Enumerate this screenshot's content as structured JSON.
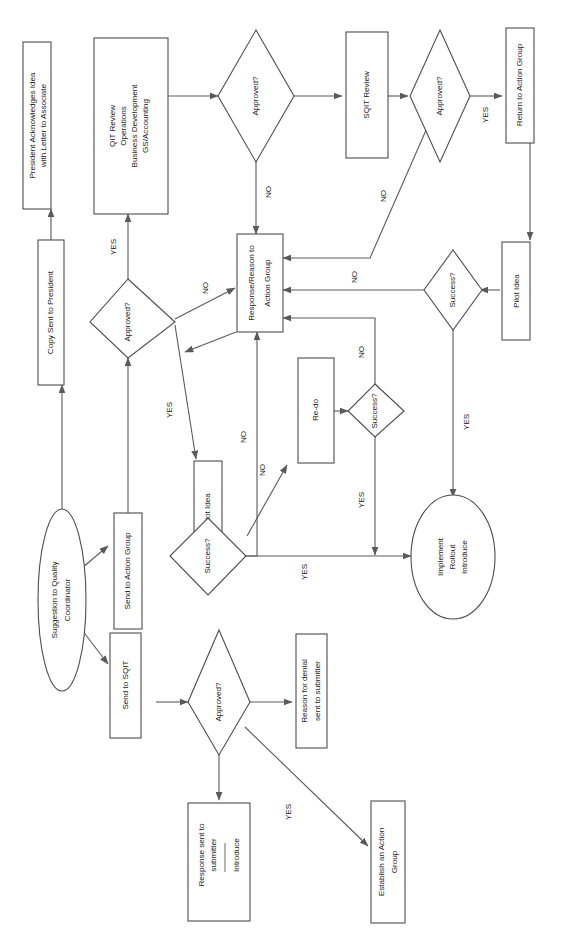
{
  "diagram": {
    "orientation": "rotated-90-ccw",
    "canvas": {
      "width": 564,
      "height": 951
    },
    "colors": {
      "background": "#ffffff",
      "shape_stroke": "#4d4d4d",
      "edge_stroke": "#5a5a5a",
      "text": "#1a1a1a"
    },
    "nodes": [
      {
        "id": "start",
        "shape": "ellipse",
        "lines": [
          "Suggestion to Quality",
          "Coordinator"
        ]
      },
      {
        "id": "send_action",
        "shape": "box",
        "lines": [
          "Send to Action Group"
        ]
      },
      {
        "id": "send_sqit",
        "shape": "box",
        "lines": [
          "Send to SQIT"
        ]
      },
      {
        "id": "approved_mid",
        "shape": "diamond",
        "lines": [
          "Approved?"
        ]
      },
      {
        "id": "qit_review",
        "shape": "box",
        "lines": [
          "QIT Review",
          "Operations",
          "Business Development",
          "GS/Accounting"
        ]
      },
      {
        "id": "approved_top",
        "shape": "diamond",
        "lines": [
          "Approved?"
        ]
      },
      {
        "id": "sqit_review",
        "shape": "box",
        "lines": [
          "SQIT Review"
        ]
      },
      {
        "id": "approved_sqit",
        "shape": "diamond",
        "lines": [
          "Approved?"
        ]
      },
      {
        "id": "return_action",
        "shape": "box",
        "lines": [
          "Return to Action Group"
        ]
      },
      {
        "id": "pilot_idea_right",
        "shape": "box",
        "lines": [
          "Pilot Idea"
        ]
      },
      {
        "id": "success_right",
        "shape": "diamond",
        "lines": [
          "Success?"
        ]
      },
      {
        "id": "response_reason",
        "shape": "box",
        "lines": [
          "Response/Reason to",
          "Action Group"
        ]
      },
      {
        "id": "copy_president",
        "shape": "box",
        "lines": [
          "Copy Sent to President"
        ]
      },
      {
        "id": "president_ack",
        "shape": "box",
        "lines": [
          "President Acknowledges Idea",
          "with Letter to Associate"
        ]
      },
      {
        "id": "pilot_idea_left",
        "shape": "box",
        "lines": [
          "Pilot Idea"
        ]
      },
      {
        "id": "success_left",
        "shape": "diamond",
        "lines": [
          "Success?"
        ]
      },
      {
        "id": "redo",
        "shape": "box",
        "lines": [
          "Re-do"
        ]
      },
      {
        "id": "success_redo",
        "shape": "diamond",
        "lines": [
          "Success?"
        ]
      },
      {
        "id": "implement",
        "shape": "ellipse",
        "lines": [
          "Implement",
          "Rollout",
          "Introduce"
        ]
      },
      {
        "id": "approved_bottom",
        "shape": "diamond",
        "lines": [
          "Approved?"
        ]
      },
      {
        "id": "reason_denial",
        "shape": "box",
        "lines": [
          "Reason for denial",
          "sent to submitter"
        ]
      },
      {
        "id": "response_submit",
        "shape": "box",
        "lines": [
          "Response sent to",
          "submitter"
        ],
        "lines_after_rule": [
          "Introduce"
        ]
      },
      {
        "id": "establish_group",
        "shape": "box",
        "lines": [
          "Establish an Action",
          "Group"
        ]
      }
    ],
    "edge_labels": {
      "yes": "YES",
      "no": "NO"
    },
    "edges": [
      {
        "from": "start",
        "to": "send_action",
        "label": ""
      },
      {
        "from": "start",
        "to": "send_sqit",
        "label": ""
      },
      {
        "from": "send_action",
        "to": "approved_mid",
        "label": ""
      },
      {
        "from": "approved_mid",
        "to": "qit_review",
        "label": "YES"
      },
      {
        "from": "approved_mid",
        "to": "response_reason",
        "label": "NO"
      },
      {
        "from": "approved_mid",
        "to": "pilot_idea_left",
        "label": "YES"
      },
      {
        "from": "qit_review",
        "to": "approved_top",
        "label": ""
      },
      {
        "from": "approved_top",
        "to": "sqit_review",
        "label": ""
      },
      {
        "from": "approved_top",
        "to": "response_reason",
        "label": "NO"
      },
      {
        "from": "sqit_review",
        "to": "approved_sqit",
        "label": ""
      },
      {
        "from": "approved_sqit",
        "to": "return_action",
        "label": "YES"
      },
      {
        "from": "approved_sqit",
        "to": "response_reason",
        "label": "NO"
      },
      {
        "from": "return_action",
        "to": "pilot_idea_right",
        "label": ""
      },
      {
        "from": "pilot_idea_right",
        "to": "success_right",
        "label": ""
      },
      {
        "from": "success_right",
        "to": "response_reason",
        "label": "NO"
      },
      {
        "from": "success_right",
        "to": "implement",
        "label": "YES"
      },
      {
        "from": "response_reason",
        "to": "approved_mid",
        "label": "YES"
      },
      {
        "from": "copy_president",
        "to": "president_ack",
        "label": ""
      },
      {
        "from": "start",
        "to": "copy_president",
        "label": ""
      },
      {
        "from": "pilot_idea_left",
        "to": "success_left",
        "label": ""
      },
      {
        "from": "success_left",
        "to": "response_reason",
        "label": "NO"
      },
      {
        "from": "success_left",
        "to": "redo",
        "label": "NO"
      },
      {
        "from": "redo",
        "to": "success_redo",
        "label": ""
      },
      {
        "from": "success_redo",
        "to": "response_reason",
        "label": "NO"
      },
      {
        "from": "success_redo",
        "to": "implement",
        "label": "YES"
      },
      {
        "from": "success_left",
        "to": "implement",
        "label": "YES"
      },
      {
        "from": "send_sqit",
        "to": "approved_bottom",
        "label": ""
      },
      {
        "from": "approved_bottom",
        "to": "reason_denial",
        "label": "NO"
      },
      {
        "from": "approved_bottom",
        "to": "response_submit",
        "label": ""
      },
      {
        "from": "approved_bottom",
        "to": "establish_group",
        "label": "YES"
      }
    ]
  },
  "labels": {
    "start": {
      "l1": "Suggestion to Quality",
      "l2": "Coordinator"
    },
    "send_action": {
      "l1": "Send to Action Group"
    },
    "send_sqit": {
      "l1": "Send to SQIT"
    },
    "approved_mid": {
      "l1": "Approved?"
    },
    "qit_review": {
      "l1": "QIT Review",
      "l2": "Operations",
      "l3": "Business Development",
      "l4": "GS/Accounting"
    },
    "approved_top": {
      "l1": "Approved?"
    },
    "sqit_review": {
      "l1": "SQIT Review"
    },
    "approved_sqit": {
      "l1": "Approved?"
    },
    "return_action": {
      "l1": "Return to Action Group"
    },
    "pilot_idea_right": {
      "l1": "Pilot Idea"
    },
    "success_right": {
      "l1": "Success?"
    },
    "response_reason": {
      "l1": "Response/Reason to",
      "l2": "Action Group"
    },
    "copy_president": {
      "l1": "Copy Sent to President"
    },
    "president_ack": {
      "l1": "President Acknowledges Idea",
      "l2": "with Letter to Associate"
    },
    "pilot_idea_left": {
      "l1": "Pilot Idea"
    },
    "success_left": {
      "l1": "Success?"
    },
    "redo": {
      "l1": "Re-do"
    },
    "success_redo": {
      "l1": "Success?"
    },
    "implement": {
      "l1": "Implement",
      "l2": "Rollout",
      "l3": "Introduce"
    },
    "approved_bottom": {
      "l1": "Approved?"
    },
    "reason_denial": {
      "l1": "Reason for denial",
      "l2": "sent to submitter"
    },
    "response_submit": {
      "l1": "Response sent to",
      "l2": "submitter",
      "l3": "Introduce"
    },
    "establish_group": {
      "l1": "Establish an Action",
      "l2": "Group"
    },
    "edge": {
      "yes1": "YES",
      "yes2": "YES",
      "yes3": "YES",
      "yes4": "YES",
      "yes5": "YES",
      "yes6": "YES",
      "yes7": "YES",
      "no1": "NO",
      "no2": "NO",
      "no3": "NO",
      "no4": "NO",
      "no5": "NO",
      "no6": "NO",
      "no7": "NO"
    }
  }
}
